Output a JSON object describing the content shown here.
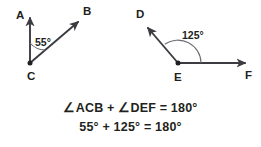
{
  "figure": {
    "background_color": "#ffffff",
    "stroke_color": "#3b3b42",
    "text_color": "#231f20"
  },
  "left_diagram": {
    "name": "angle-ACB",
    "vertex_label": "C",
    "ray_labels": [
      "A",
      "B"
    ],
    "angle_value": "55°",
    "angle_measure_degrees": 55,
    "points": {
      "A": {
        "label": "A",
        "x": 16,
        "y": 19
      },
      "B": {
        "label": "B",
        "x": 83,
        "y": 15
      },
      "C": {
        "label": "C",
        "x": 27,
        "y": 80
      }
    },
    "vertex_point": {
      "x": 30,
      "y": 63
    },
    "ray_a_tip": {
      "x": 30,
      "y": 14
    },
    "ray_b_tip": {
      "x": 81,
      "y": 19
    },
    "arc_radius": 20
  },
  "right_diagram": {
    "name": "angle-DEF",
    "vertex_label": "E",
    "ray_labels": [
      "D",
      "F"
    ],
    "angle_value": "125°",
    "angle_measure_degrees": 125,
    "points": {
      "D": {
        "label": "D",
        "x": 136,
        "y": 18
      },
      "E": {
        "label": "E",
        "x": 174,
        "y": 81
      },
      "F": {
        "label": "F",
        "x": 245,
        "y": 79
      }
    },
    "vertex_point": {
      "x": 178,
      "y": 63
    },
    "ray_d_tip": {
      "x": 145,
      "y": 25
    },
    "ray_f_tip": {
      "x": 249,
      "y": 63
    },
    "arc_radius": 23
  },
  "equations": {
    "line1": "∠ACB + ∠DEF = 180°",
    "line2": "55°  +  125°  =  180°"
  }
}
